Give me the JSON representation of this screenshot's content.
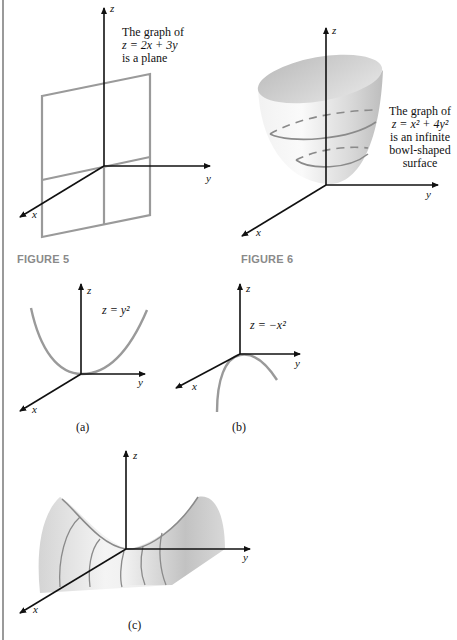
{
  "figure5": {
    "caption": "FIGURE 5",
    "annotation": {
      "line1": "The graph of",
      "line2": "z = 2x + 3y",
      "line3": "is a plane"
    },
    "axes": {
      "x": "x",
      "y": "y",
      "z": "z"
    },
    "plane_color": "#9a9a9a"
  },
  "figure6": {
    "caption": "FIGURE 6",
    "annotation": {
      "line1": "The graph of",
      "line2": "z = x² + 4y²",
      "line3": "is an infinite",
      "line4": "bowl-shaped",
      "line5": "surface"
    },
    "axes": {
      "x": "x",
      "y": "y",
      "z": "z"
    }
  },
  "figure_a": {
    "label": "(a)",
    "equation": "z = y²",
    "axes": {
      "x": "x",
      "y": "y",
      "z": "z"
    }
  },
  "figure_b": {
    "label": "(b)",
    "equation": "z = −x²",
    "axes": {
      "x": "x",
      "y": "y",
      "z": "z"
    }
  },
  "figure_c": {
    "label": "(c)",
    "axes": {
      "x": "x",
      "y": "y",
      "z": "z"
    }
  },
  "colors": {
    "curve": "#9a9a9a",
    "axis": "#111111",
    "caption": "#8a8a8a"
  }
}
